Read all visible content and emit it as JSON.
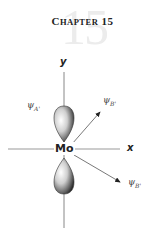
{
  "header": {
    "chapter_word_initial": "C",
    "chapter_word_rest": "HAPTER",
    "chapter_number": "15",
    "watermark_number": "15"
  },
  "diagram": {
    "center_label": "Mo",
    "x_axis_label": "x",
    "y_axis_label": "y",
    "orbitals": [
      {
        "symbol": "ψ",
        "subscript": "A'",
        "position": "upper-left lobe"
      },
      {
        "symbol": "ψ",
        "subscript": "B'",
        "position": "upper-right arrow"
      },
      {
        "symbol": "ψ",
        "subscript": "B'",
        "position": "lower-right arrow"
      }
    ]
  }
}
